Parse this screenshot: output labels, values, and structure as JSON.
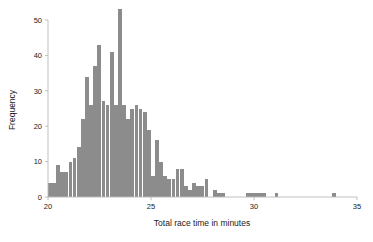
{
  "chart_data": {
    "type": "bar",
    "title": "",
    "subtitle": "",
    "xlabel": "Total race time in minutes",
    "ylabel": "Frequency",
    "xlim": [
      20,
      35
    ],
    "ylim": [
      0,
      53
    ],
    "xticks": [
      20,
      25,
      30,
      35
    ],
    "xtick_labels": [
      "20",
      "25",
      "30",
      "35"
    ],
    "yticks": [
      0,
      10,
      20,
      30,
      40,
      50
    ],
    "ytick_labels": [
      "0",
      "10",
      "20",
      "30",
      "40",
      "50"
    ],
    "grid": false,
    "legend": null,
    "bar_color": "#8c8c8c",
    "bin_width": 0.2,
    "bin_starts": [
      20.0,
      20.2,
      20.4,
      20.6,
      20.8,
      21.0,
      21.2,
      21.4,
      21.6,
      21.8,
      22.0,
      22.2,
      22.4,
      22.6,
      22.8,
      23.0,
      23.2,
      23.4,
      23.6,
      23.8,
      24.0,
      24.2,
      24.4,
      24.6,
      24.8,
      25.0,
      25.2,
      25.4,
      25.6,
      25.8,
      26.0,
      26.2,
      26.4,
      26.6,
      26.8,
      27.0,
      27.2,
      27.4,
      27.6,
      27.8,
      28.0,
      28.2,
      28.4,
      28.6,
      28.8,
      29.0,
      29.2,
      29.4,
      29.6,
      29.8,
      30.0,
      30.2,
      30.4,
      30.6,
      30.8,
      31.0,
      31.2,
      31.4,
      31.6,
      31.8,
      32.0,
      32.2,
      32.4,
      32.6,
      32.8,
      33.0,
      33.2,
      33.4,
      33.6,
      33.8,
      34.0,
      34.2,
      34.4,
      34.6,
      34.8
    ],
    "categories": [
      "20.0",
      "20.2",
      "20.4",
      "20.6",
      "20.8",
      "21.0",
      "21.2",
      "21.4",
      "21.6",
      "21.8",
      "22.0",
      "22.2",
      "22.4",
      "22.6",
      "22.8",
      "23.0",
      "23.2",
      "23.4",
      "23.6",
      "23.8",
      "24.0",
      "24.2",
      "24.4",
      "24.6",
      "24.8",
      "25.0",
      "25.2",
      "25.4",
      "25.6",
      "25.8",
      "26.0",
      "26.2",
      "26.4",
      "26.6",
      "26.8",
      "27.0",
      "27.2",
      "27.4",
      "27.6",
      "27.8",
      "28.0",
      "28.2",
      "28.4",
      "28.6",
      "28.8",
      "29.0",
      "29.2",
      "29.4",
      "29.6",
      "29.8",
      "30.0",
      "30.2",
      "30.4",
      "30.6",
      "30.8",
      "31.0",
      "31.2",
      "31.4",
      "31.6",
      "31.8",
      "32.0",
      "32.2",
      "32.4",
      "32.6",
      "32.8",
      "33.0",
      "33.2",
      "33.4",
      "33.6",
      "33.8",
      "34.0",
      "34.2",
      "34.4",
      "34.6",
      "34.8"
    ],
    "values": [
      4,
      4,
      9,
      7,
      7,
      10,
      11,
      14,
      22,
      34,
      26,
      37,
      43,
      27,
      26,
      41,
      26,
      53,
      26,
      22,
      25,
      26,
      25,
      24,
      19,
      6,
      16,
      10,
      6,
      5,
      5,
      8,
      8,
      3,
      2,
      4,
      3,
      3,
      5,
      0,
      2,
      1,
      1,
      0,
      0,
      0,
      0,
      0,
      1,
      1,
      1,
      1,
      1,
      0,
      0,
      1,
      0,
      0,
      0,
      0,
      0,
      0,
      0,
      0,
      0,
      0,
      0,
      0,
      0,
      1,
      0,
      0,
      0,
      0,
      0
    ]
  },
  "figure": {
    "background": "#ffffff",
    "bar_color": "#8c8c8c",
    "axis_color": "#b9b9b9",
    "text_color": "#1a1a1a"
  }
}
